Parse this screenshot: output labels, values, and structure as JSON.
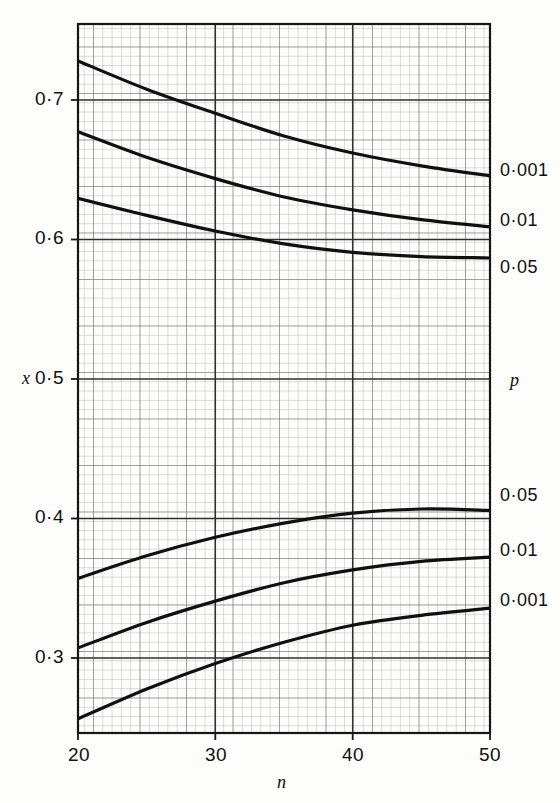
{
  "chart_data": {
    "type": "line",
    "title": "",
    "subtitle": "",
    "xlabel": "n",
    "ylabel": "x",
    "legend_axis_title": "p",
    "legend_position": "right-of-plot-at-curve-ends",
    "grid": true,
    "grid_style": "fine graph paper, minor every 0.005 in x, major every 0.05 in x",
    "xlim": [
      20,
      50
    ],
    "ylim": [
      0.26,
      0.76
    ],
    "xticks": [
      20,
      30,
      40,
      50
    ],
    "xtick_labels": [
      "20",
      "30",
      "40",
      "50"
    ],
    "yticks": [
      0.3,
      0.4,
      0.5,
      0.6,
      0.7
    ],
    "ytick_labels": [
      "0·3",
      "0·4",
      "0·5",
      "0·6",
      "0·7"
    ],
    "x": [
      20,
      25,
      30,
      35,
      40,
      45,
      50
    ],
    "series": [
      {
        "name": "0·001 upper",
        "label": "0·001",
        "label_side": "right",
        "group": "upper",
        "values": [
          0.734,
          0.714,
          0.697,
          0.681,
          0.669,
          0.66,
          0.653
        ]
      },
      {
        "name": "0·01 upper",
        "label": "0·01",
        "label_side": "right",
        "group": "upper",
        "values": [
          0.684,
          0.666,
          0.651,
          0.638,
          0.629,
          0.622,
          0.617
        ]
      },
      {
        "name": "0·05 upper",
        "label": "0·05",
        "label_side": "right",
        "group": "upper",
        "values": [
          0.637,
          0.625,
          0.614,
          0.605,
          0.599,
          0.596,
          0.595
        ]
      },
      {
        "name": "0·05 lower",
        "label": "0·05",
        "label_side": "right",
        "group": "lower",
        "values": [
          0.369,
          0.385,
          0.398,
          0.408,
          0.415,
          0.418,
          0.417
        ]
      },
      {
        "name": "0·01 lower",
        "label": "0·01",
        "label_side": "right",
        "group": "lower",
        "values": [
          0.32,
          0.338,
          0.353,
          0.366,
          0.375,
          0.381,
          0.384
        ]
      },
      {
        "name": "0·001 lower",
        "label": "0·001",
        "label_side": "right",
        "group": "lower",
        "values": [
          0.27,
          0.291,
          0.309,
          0.324,
          0.336,
          0.343,
          0.348
        ]
      }
    ],
    "colors": {
      "curve": "#101010",
      "major_grid": "#3a3a3a",
      "minor_grid": "#9a9a9a",
      "axis_frame": "#1a1a1a",
      "background": "#fdfdfc"
    }
  },
  "axes": {
    "y_title": "x",
    "x_title": "n",
    "p_title": "p"
  },
  "ytick_labels": {
    "t0": "0·3",
    "t1": "0·4",
    "t2": "0·5",
    "t3": "0·6",
    "t4": "0·7"
  },
  "xtick_labels": {
    "t0": "20",
    "t1": "30",
    "t2": "40",
    "t3": "50"
  },
  "curve_labels": {
    "upper_0": "0·001",
    "upper_1": "0·01",
    "upper_2": "0·05",
    "lower_0": "0·05",
    "lower_1": "0·01",
    "lower_2": "0·001"
  }
}
